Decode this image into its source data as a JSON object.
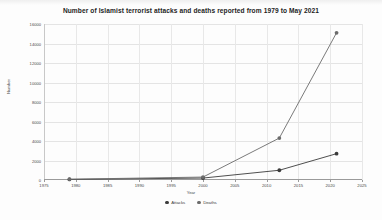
{
  "chart_data": {
    "type": "line",
    "title": "Number of Islamist terrorist attacks and  deaths reported from 1979 to May 2021",
    "xlabel": "Year",
    "ylabel": "Number",
    "xlim": [
      1975,
      2025
    ],
    "ylim": [
      0,
      16000
    ],
    "grid": true,
    "legend_position": "bottom",
    "x_ticks": [
      1975,
      1980,
      1985,
      1990,
      1995,
      2000,
      2005,
      2010,
      2015,
      2020,
      2025
    ],
    "x_tick_labels": [
      "1975",
      "1980",
      "1985",
      "1990",
      "1995",
      "2000",
      "2005",
      "2010",
      "2015",
      "2020",
      "2025"
    ],
    "y_ticks": [
      0,
      2000,
      4000,
      6000,
      8000,
      10000,
      12000,
      14000,
      16000
    ],
    "y_tick_labels": [
      "0",
      "2000",
      "4000",
      "6000",
      "8000",
      "10000",
      "12000",
      "14000",
      "16000"
    ],
    "x": [
      1979,
      2000,
      2012,
      2021
    ],
    "series": [
      {
        "name": "Attacks",
        "color": "#3b3b3b",
        "values": [
          60,
          200,
          1000,
          2700
        ]
      },
      {
        "name": "Deaths",
        "color": "#6b6b6b",
        "values": [
          80,
          300,
          4300,
          15100
        ]
      }
    ]
  },
  "legend": {
    "items": [
      {
        "label": "Attacks",
        "color": "#3b3b3b"
      },
      {
        "label": "Deaths",
        "color": "#6b6b6b"
      }
    ]
  }
}
